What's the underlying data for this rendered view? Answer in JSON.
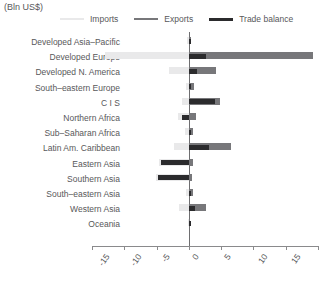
{
  "units_label": "(Bln US$)",
  "legend": {
    "position": "top",
    "items": [
      {
        "label": "Imports",
        "color": "#e9e9ea",
        "key": "imports"
      },
      {
        "label": "Exports",
        "color": "#77777a",
        "key": "exports"
      },
      {
        "label": "Trade balance",
        "color": "#2b2b2d",
        "key": "balance"
      }
    ]
  },
  "colors": {
    "imports": "#e9e9ea",
    "exports": "#77777a",
    "balance": "#2b2b2d",
    "axis": "#8a8a8c",
    "text": "#58585a",
    "background": "#ffffff"
  },
  "axis": {
    "tick_labels": [
      "-15",
      "-10",
      "-5",
      "0",
      "5",
      "10",
      "15",
      "20"
    ],
    "tick_values": [
      -15,
      -10,
      -5,
      0,
      5,
      10,
      15,
      20
    ],
    "min": -15,
    "max": 20,
    "grid": false
  },
  "chart_data": {
    "type": "bar",
    "orientation": "horizontal",
    "title": "",
    "subtitle": "",
    "xlabel": "(Bln US$)",
    "ylabel": "",
    "xlim": [
      -15,
      20
    ],
    "grid": false,
    "legend_position": "top",
    "categories": [
      "Developed Asia–Pacific",
      "Developed Europe",
      "Developed N. America",
      "South–eastern Europe",
      "C I S",
      "Northern Africa",
      "Sub–Saharan Africa",
      "Latin Am. Caribbean",
      "Eastern Asia",
      "Southern Asia",
      "South–eastern Asia",
      "Western Asia",
      "Oceania"
    ],
    "series": [
      {
        "name": "Imports",
        "color": "#e9e9ea",
        "note": "plotted as negative values extending left of zero",
        "values": [
          -0.3,
          -13.0,
          -3.1,
          -0.5,
          -1.0,
          -1.7,
          -0.6,
          -2.3,
          -4.6,
          -5.1,
          -0.4,
          -1.6,
          -0.1
        ]
      },
      {
        "name": "Exports",
        "color": "#77777a",
        "note": "plotted as positive values extending right of zero",
        "values": [
          0.4,
          19.2,
          4.2,
          0.8,
          4.8,
          1.1,
          0.7,
          6.6,
          0.7,
          0.5,
          0.6,
          2.6,
          0.1
        ]
      },
      {
        "name": "Trade balance",
        "color": "#2b2b2d",
        "values": [
          0.2,
          2.7,
          1.2,
          0.4,
          4.0,
          -1.0,
          0.3,
          3.1,
          -4.3,
          -4.8,
          0.3,
          0.9,
          0.05
        ]
      }
    ]
  }
}
